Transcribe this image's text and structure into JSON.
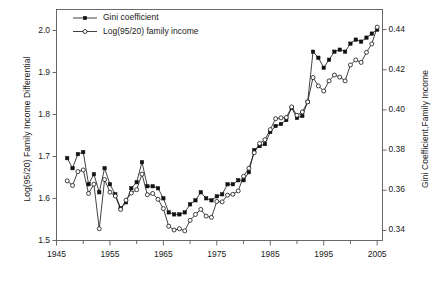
{
  "chart_data": {
    "type": "line",
    "title": "",
    "xlabel": "",
    "ylabel": "Log(95/20) Family Income Differential",
    "ylabel_right": "Gini Coefficient,Family Income",
    "xlim": [
      1945,
      2006
    ],
    "ylim": [
      1.5,
      2.05
    ],
    "ylim_right": [
      0.335,
      0.45
    ],
    "xticks": [
      1945,
      1955,
      1965,
      1975,
      1985,
      1995,
      2005
    ],
    "xticks_minor": [
      1950,
      1960,
      1970,
      1980,
      1990,
      2000
    ],
    "yticks": [
      1.5,
      1.6,
      1.7,
      1.8,
      1.9,
      2.0
    ],
    "yticks_right": [
      0.34,
      0.36,
      0.38,
      0.4,
      0.42,
      0.44
    ],
    "grid": false,
    "legend_position": "top-left",
    "series": [
      {
        "name": "Gini coefficient",
        "marker": "filled-square",
        "axis": "right",
        "x": [
          1947,
          1948,
          1949,
          1950,
          1951,
          1952,
          1953,
          1954,
          1955,
          1956,
          1957,
          1958,
          1959,
          1960,
          1961,
          1962,
          1963,
          1964,
          1965,
          1966,
          1967,
          1968,
          1969,
          1970,
          1971,
          1972,
          1973,
          1974,
          1975,
          1976,
          1977,
          1978,
          1979,
          1980,
          1981,
          1982,
          1983,
          1984,
          1985,
          1986,
          1987,
          1988,
          1989,
          1990,
          1991,
          1992,
          1993,
          1994,
          1995,
          1996,
          1997,
          1998,
          1999,
          2000,
          2001,
          2002,
          2003,
          2004,
          2005
        ],
        "values": [
          0.376,
          0.371,
          0.378,
          0.379,
          0.363,
          0.368,
          0.359,
          0.371,
          0.363,
          0.358,
          0.351,
          0.354,
          0.361,
          0.364,
          0.374,
          0.362,
          0.362,
          0.361,
          0.356,
          0.349,
          0.348,
          0.348,
          0.349,
          0.353,
          0.355,
          0.359,
          0.356,
          0.355,
          0.357,
          0.358,
          0.363,
          0.363,
          0.365,
          0.365,
          0.369,
          0.38,
          0.382,
          0.383,
          0.389,
          0.392,
          0.393,
          0.395,
          0.401,
          0.396,
          0.397,
          0.404,
          0.429,
          0.426,
          0.421,
          0.425,
          0.429,
          0.43,
          0.429,
          0.433,
          0.435,
          0.434,
          0.436,
          0.438,
          0.44
        ]
      },
      {
        "name": "Log(95/20) family income",
        "marker": "open-circle",
        "axis": "left",
        "x": [
          1947,
          1948,
          1949,
          1950,
          1951,
          1952,
          1953,
          1954,
          1955,
          1956,
          1957,
          1958,
          1959,
          1960,
          1961,
          1962,
          1963,
          1964,
          1965,
          1966,
          1967,
          1968,
          1969,
          1970,
          1971,
          1972,
          1973,
          1974,
          1975,
          1976,
          1977,
          1978,
          1979,
          1980,
          1981,
          1982,
          1983,
          1984,
          1985,
          1986,
          1987,
          1988,
          1989,
          1990,
          1991,
          1992,
          1993,
          1994,
          1995,
          1996,
          1997,
          1998,
          1999,
          2000,
          2001,
          2002,
          2003,
          2004,
          2005
        ],
        "values": [
          1.642,
          1.631,
          1.664,
          1.668,
          1.612,
          1.634,
          1.528,
          1.645,
          1.615,
          1.606,
          1.574,
          1.596,
          1.613,
          1.621,
          1.658,
          1.609,
          1.612,
          1.598,
          1.576,
          1.534,
          1.525,
          1.528,
          1.523,
          1.548,
          1.562,
          1.574,
          1.558,
          1.555,
          1.593,
          1.592,
          1.608,
          1.61,
          1.618,
          1.653,
          1.672,
          1.709,
          1.731,
          1.74,
          1.764,
          1.79,
          1.792,
          1.793,
          1.818,
          1.798,
          1.806,
          1.83,
          1.888,
          1.868,
          1.856,
          1.88,
          1.894,
          1.889,
          1.88,
          1.918,
          1.93,
          1.924,
          1.948,
          1.968,
          2.008
        ]
      }
    ]
  },
  "axes": {
    "left_title": "Log(95/20) Family Income Differential",
    "right_title": "Gini Coefficient,Family Income",
    "left_ticks": [
      "1.5",
      "1.6",
      "1.7",
      "1.8",
      "1.9",
      "2.0"
    ],
    "right_ticks": [
      "0.34",
      "0.36",
      "0.38",
      "0.40",
      "0.42",
      "0.44"
    ],
    "x_ticks": [
      "1945",
      "1955",
      "1965",
      "1975",
      "1985",
      "1995",
      "2005"
    ]
  },
  "legend": {
    "items": [
      {
        "label": "Gini coefficient",
        "marker": "filled-square"
      },
      {
        "label": "Log(95/20) family income",
        "marker": "open-circle"
      }
    ]
  }
}
